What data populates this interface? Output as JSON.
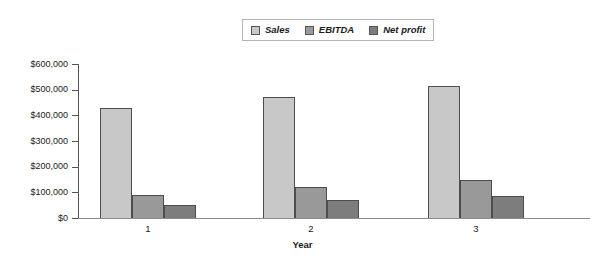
{
  "chart_data": {
    "type": "bar",
    "title": "",
    "xlabel": "Year",
    "ylabel": "",
    "categories": [
      "1",
      "2",
      "3"
    ],
    "series": [
      {
        "name": "Sales",
        "values": [
          430000,
          470000,
          515000
        ],
        "color": "#c8c8c8"
      },
      {
        "name": "EBITDA",
        "values": [
          90000,
          120000,
          148000
        ],
        "color": "#999999"
      },
      {
        "name": "Net profit",
        "values": [
          50000,
          70000,
          85000
        ],
        "color": "#7d7d7d"
      }
    ],
    "ylim": [
      0,
      600000
    ],
    "ytick_values": [
      0,
      100000,
      200000,
      300000,
      400000,
      500000,
      600000
    ],
    "ytick_labels": [
      "$0",
      "$100,000",
      "$200,000",
      "$300,000",
      "$400,000",
      "$500,000",
      "$600,000"
    ],
    "grid": false,
    "legend_position": "top-center",
    "legend_entries": [
      "Sales",
      "EBITDA",
      "Net profit"
    ]
  },
  "axis": {
    "x_title": "Year"
  },
  "legend": {
    "items": [
      {
        "label": "Sales"
      },
      {
        "label": "EBITDA"
      },
      {
        "label": "Net profit"
      }
    ]
  },
  "colors": {
    "sales": "#c8c8c8",
    "ebitda": "#999999",
    "net_profit": "#7d7d7d",
    "axis": "#555555",
    "bar_border": "#4d4d4d",
    "background": "#ffffff"
  }
}
